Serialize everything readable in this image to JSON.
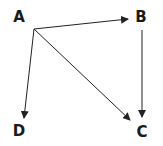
{
  "diagram": {
    "type": "directed-graph",
    "nodes": [
      {
        "id": "A",
        "label": "A",
        "x": 19,
        "y": 22
      },
      {
        "id": "B",
        "label": "B",
        "x": 141,
        "y": 22
      },
      {
        "id": "D",
        "label": "D",
        "x": 19,
        "y": 136
      },
      {
        "id": "C",
        "label": "C",
        "x": 142,
        "y": 137
      }
    ],
    "edges": [
      {
        "from": "A",
        "to": "B"
      },
      {
        "from": "A",
        "to": "D"
      },
      {
        "from": "A",
        "to": "C"
      },
      {
        "from": "B",
        "to": "C"
      }
    ],
    "colors": {
      "stroke": "#222222",
      "text": "#1a1a1a",
      "background": "#ffffff"
    }
  }
}
